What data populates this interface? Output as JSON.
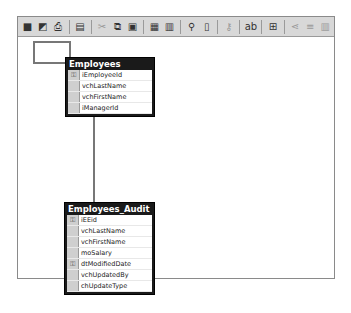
{
  "toolbar": {
    "items": [
      {
        "name": "save-icon",
        "glyph": "■"
      },
      {
        "name": "properties-icon",
        "glyph": "◩"
      },
      {
        "name": "print-icon",
        "glyph": "⎙"
      },
      {
        "name": "sep"
      },
      {
        "name": "layout-icon",
        "glyph": "▤"
      },
      {
        "name": "sep"
      },
      {
        "name": "cut-icon",
        "glyph": "✂",
        "disabled": true
      },
      {
        "name": "copy-icon",
        "glyph": "⧉"
      },
      {
        "name": "paste-icon",
        "glyph": "▣"
      },
      {
        "name": "sep"
      },
      {
        "name": "new-table-icon",
        "glyph": "▦"
      },
      {
        "name": "add-table-icon",
        "glyph": "▥"
      },
      {
        "name": "sep"
      },
      {
        "name": "zoom-icon",
        "glyph": "⚲"
      },
      {
        "name": "page-icon",
        "glyph": "▯"
      },
      {
        "name": "sep"
      },
      {
        "name": "primary-key-icon",
        "glyph": "⚷",
        "disabled": true
      },
      {
        "name": "sep"
      },
      {
        "name": "label-icon",
        "glyph": "ab"
      },
      {
        "name": "sep"
      },
      {
        "name": "arrange-tables-icon",
        "glyph": "⊞"
      },
      {
        "name": "sep"
      },
      {
        "name": "relationships-icon",
        "glyph": "⋖",
        "disabled": true
      },
      {
        "name": "indexes-icon",
        "glyph": "≡",
        "disabled": true
      },
      {
        "name": "table-view-icon",
        "glyph": "▥",
        "disabled": true
      }
    ]
  },
  "tables": [
    {
      "title": "Employees",
      "columns": [
        {
          "name": "iEmployeeId",
          "key": true
        },
        {
          "name": "vchLastName",
          "key": false
        },
        {
          "name": "vchFirstName",
          "key": false
        },
        {
          "name": "iManagerId",
          "key": false
        }
      ]
    },
    {
      "title": "Employees_Audit",
      "columns": [
        {
          "name": "iEEid",
          "key": true
        },
        {
          "name": "vchLastName",
          "key": false
        },
        {
          "name": "vchFirstName",
          "key": false
        },
        {
          "name": "moSalary",
          "key": false
        },
        {
          "name": "dtModifiedDate",
          "key": true
        },
        {
          "name": "vchUpdatedBy",
          "key": false
        },
        {
          "name": "chUpdateType",
          "key": false
        }
      ]
    }
  ],
  "icons": {
    "key": "⚿"
  }
}
